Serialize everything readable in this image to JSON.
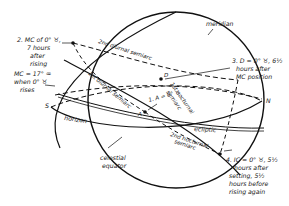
{
  "labels": {
    "meridian": "meridian",
    "horizon": "horizon",
    "ecliptic": "ecliptic",
    "celestial_equator": [
      "celestial",
      "equator"
    ],
    "south": "S",
    "north": "N",
    "second_diurnal": "2nd diurnal semiarc",
    "first_diurnal": "1st diurnal semiarc",
    "first_nocturnal": [
      "1st nocturnal",
      "semiarc"
    ],
    "second_nocturnal": [
      "2nd nocturnal",
      "semiarc"
    ],
    "point_a": "1. A = 0° ♉",
    "point_a_letter": "A",
    "point_d_letter": "D",
    "note2": [
      "2.  MC of 0° ♉,",
      "7 hours",
      "after",
      "rising"
    ],
    "note_mc": [
      "MC = 17° ♒",
      "when 0° ♉",
      "rises"
    ],
    "note3": [
      "3.  D = 0° ♉, 6½",
      "hours after",
      "MC position"
    ],
    "note4": [
      "4.  IC = 0° ♉, 5½",
      "hours after",
      "setting, 5½",
      "hours before",
      "rising again"
    ]
  }
}
